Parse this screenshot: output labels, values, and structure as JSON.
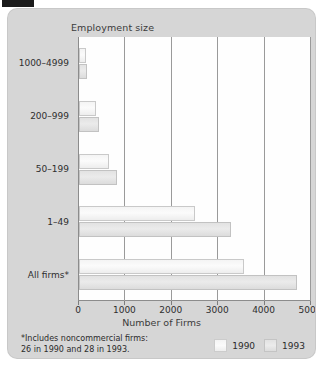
{
  "chart_data": {
    "type": "bar",
    "orientation": "horizontal",
    "title": "",
    "xlabel": "Number of Firms",
    "ylabel": "Employment size",
    "xlim": [
      0,
      5000
    ],
    "xticks": [
      0,
      1000,
      2000,
      3000,
      4000,
      5000
    ],
    "xtick_labels": [
      "0",
      "1000",
      "2000",
      "3000",
      "4000",
      "5000"
    ],
    "grid": true,
    "grid_axis": "x",
    "legend_position": "bottom-right",
    "categories": [
      "1000–4999",
      "200–999",
      "50–199",
      "1–49",
      "All firms*"
    ],
    "series": [
      {
        "name": "1990",
        "color": "#f7f7f7",
        "values": [
          150,
          370,
          640,
          2500,
          3550
        ]
      },
      {
        "name": "1993",
        "color": "#e5e5e5",
        "values": [
          170,
          430,
          810,
          3280,
          4700
        ]
      }
    ],
    "footnote": "*Includes noncommercial firms:\n26 in 1990 and 28 in 1993."
  },
  "panel": {
    "background_color": "#d6d6d6",
    "plot_background_color": "#fefefe",
    "gridline_color": "#9a9a9a",
    "axis_color": "#8c8c8c"
  },
  "marker": {
    "name": "top-left-marker",
    "color": "#1a1a1a"
  }
}
